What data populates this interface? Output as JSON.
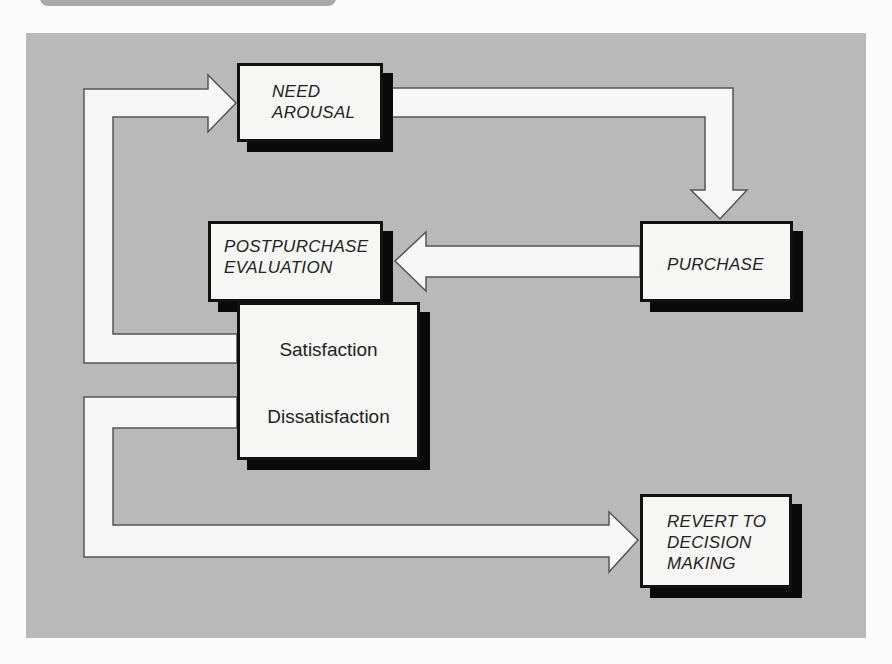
{
  "diagram": {
    "type": "flowchart",
    "title": "",
    "colors": {
      "panel_background": "#b9b9b9",
      "box_fill": "#f6f6f4",
      "box_border": "#111111",
      "box_shadow": "#0a0a0a",
      "arrow_fill": "#f7f7f7",
      "arrow_outline": "#555555",
      "text": "#222222"
    },
    "nodes": {
      "need_arousal": {
        "id": "need_arousal",
        "label": "NEED\nAROUSAL"
      },
      "purchase": {
        "id": "purchase",
        "label": "PURCHASE"
      },
      "postpurchase_evaluation": {
        "id": "postpurchase_evaluation",
        "label": "POSTPURCHASE\nEVALUATION"
      },
      "outcomes": {
        "id": "outcomes",
        "satisfaction": "Satisfaction",
        "dissatisfaction": "Dissatisfaction"
      },
      "revert": {
        "id": "revert",
        "label": "REVERT TO\nDECISION\nMAKING"
      }
    },
    "edges": [
      {
        "from": "need_arousal",
        "to": "purchase",
        "style": "hollow-arrow"
      },
      {
        "from": "purchase",
        "to": "postpurchase_evaluation",
        "style": "hollow-arrow"
      },
      {
        "from": "outcomes.satisfaction",
        "to": "need_arousal",
        "style": "hollow-arrow"
      },
      {
        "from": "outcomes.dissatisfaction",
        "to": "revert",
        "style": "hollow-arrow"
      }
    ]
  }
}
